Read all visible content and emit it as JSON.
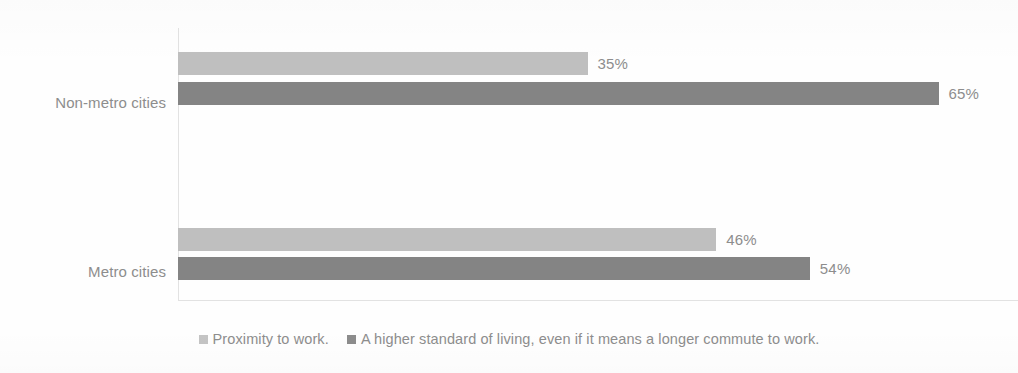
{
  "chart_data": {
    "type": "bar",
    "orientation": "horizontal",
    "title": "",
    "subtitle": "",
    "xlabel": "",
    "ylabel": "",
    "grid": false,
    "legend_position": "bottom",
    "xlim": [
      0,
      100
    ],
    "value_suffix": "%",
    "categories": [
      "Non-metro cities",
      "Metro cities"
    ],
    "series": [
      {
        "name": "Proximity to work.",
        "color": "#bfbfbf",
        "values": [
          35,
          46
        ],
        "value_labels": [
          "35%",
          "46%"
        ]
      },
      {
        "name": "A higher standard of living, even if it means a longer commute to work.",
        "color": "#848484",
        "values": [
          65,
          54
        ],
        "value_labels": [
          "65%",
          "54%"
        ]
      }
    ]
  },
  "axis": {
    "category_labels": [
      "Non-metro cities",
      "Metro cities"
    ]
  },
  "legend": {
    "items": [
      {
        "label": "Proximity to work.",
        "color": "#c4c4c4"
      },
      {
        "label": "A higher standard of living, even if it means a longer commute to work.",
        "color": "#8c8c8c"
      }
    ]
  }
}
